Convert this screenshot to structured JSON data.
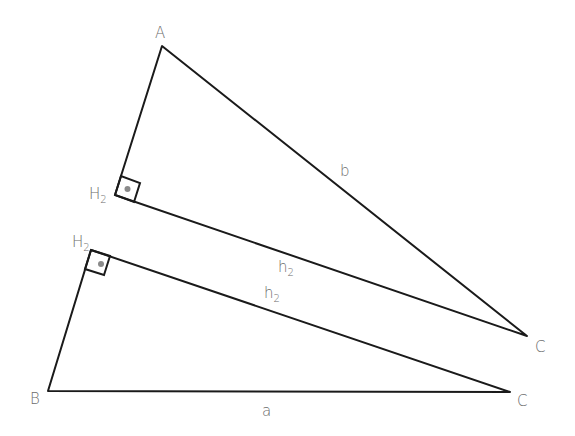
{
  "figure": {
    "background": "#ffffff",
    "line_color": "#1a1a1a",
    "label_color": "#6b6b6b",
    "triangles": [
      {
        "id": "upper",
        "vertices": {
          "A": {
            "label": "A",
            "x": 162,
            "y": 46
          },
          "H2": {
            "label": "H",
            "sub": "2",
            "x": 115,
            "y": 195
          },
          "C": {
            "label": "C",
            "x": 527,
            "y": 336
          }
        },
        "sides": {
          "hyp": {
            "label": "b"
          },
          "leg": {
            "label": "h",
            "sub": "2"
          }
        },
        "right_angle_at": "H2"
      },
      {
        "id": "lower",
        "vertices": {
          "H2": {
            "label": "H",
            "sub": "2",
            "x": 91,
            "y": 250
          },
          "B": {
            "label": "B",
            "x": 48,
            "y": 391
          },
          "C": {
            "label": "C",
            "x": 510,
            "y": 392
          }
        },
        "sides": {
          "base": {
            "label": "a"
          },
          "leg": {
            "label": "h",
            "sub": "2"
          }
        },
        "right_angle_at": "H2"
      }
    ]
  }
}
